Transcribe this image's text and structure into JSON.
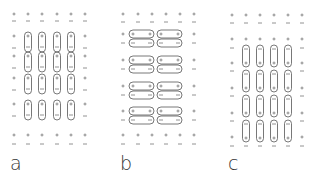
{
  "figure": {
    "panels": [
      {
        "id": "a",
        "label": "a",
        "description": "vertical dipole pairs, + on top, - on bottom, 4x4 grid inside border of free charges"
      },
      {
        "id": "b",
        "label": "b",
        "description": "horizontal paired charges, + row over - row, 2 columns x 4 rows"
      },
      {
        "id": "c",
        "label": "c",
        "description": "vertically elongated dipoles offset: - on top, + on bottom, 4x4 grid"
      }
    ],
    "symbols": {
      "plus": "+",
      "minus": "−"
    },
    "caption_fragment": "",
    "colors": {
      "line": "#555555",
      "charge": "#777777",
      "label": "#333333"
    }
  }
}
